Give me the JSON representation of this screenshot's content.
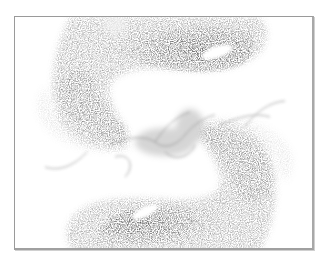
{
  "artwork": {
    "description": "Grayscale stippled particle rendering of two mirrored swirling ribbon shapes (strange attractor style) meeting at the center",
    "palette": {
      "background": "#ffffff",
      "frame": "#9a9a9a",
      "ink_dark": "#1e1e1e",
      "ink_mid": "#6a6a6a",
      "ink_light": "#b5b5b5"
    },
    "frame": {
      "x": 14,
      "y": 16,
      "width": 300,
      "height": 234
    }
  }
}
